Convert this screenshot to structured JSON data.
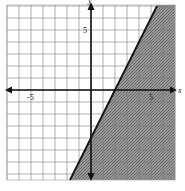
{
  "chart_data": {
    "type": "inequality-graph",
    "title": "",
    "xlabel": "x",
    "ylabel": "y",
    "xlim": [
      -7,
      7
    ],
    "ylim": [
      -7.5,
      7
    ],
    "grid": true,
    "grid_step": 1,
    "tick_labels": {
      "x": [
        {
          "value": -5,
          "label": "-5"
        },
        {
          "value": 5,
          "label": "5"
        }
      ],
      "y": [
        {
          "value": 5,
          "label": "5"
        }
      ]
    },
    "boundary_line": {
      "slope": 2,
      "intercept": -4,
      "style": "solid",
      "points": [
        [
          -1.75,
          -7.5
        ],
        [
          5.5,
          7
        ]
      ]
    },
    "inequality": "y ≤ 2x − 4",
    "shaded_region": "below-right of line",
    "colors": {
      "shade": "#8a8a8a",
      "grid": "#7a7a7a",
      "line": "#111111",
      "axis": "#111111"
    }
  },
  "labels": {
    "x_axis": "x",
    "y_axis": "y",
    "x_neg5": "-5",
    "x_pos5": "5",
    "y_pos5": "5"
  }
}
